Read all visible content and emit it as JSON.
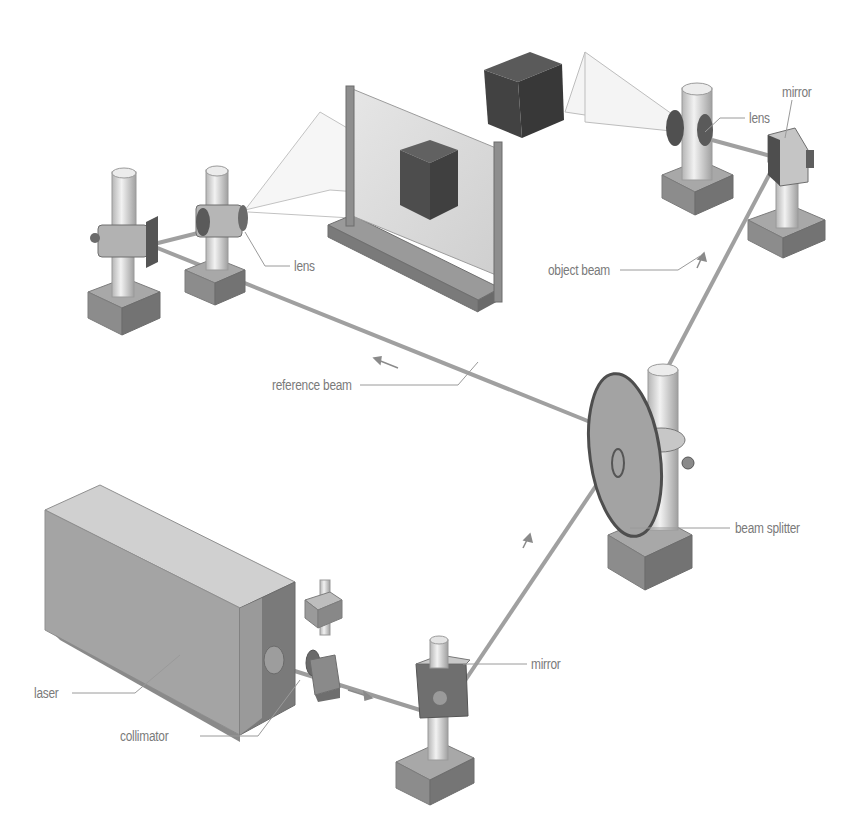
{
  "diagram": {
    "type": "holography-setup",
    "colors": {
      "background": "#ffffff",
      "label_text": "#7a7a7a",
      "leader_line": "#9a9a9a",
      "beam": "#a8a8a8",
      "metal_light": "#d9d9d9",
      "metal_mid": "#a9a9a9",
      "metal_dark": "#6e6e6e",
      "object_cube": "#4a4a4a"
    },
    "labels": {
      "lens_top": "lens",
      "mirror_top": "mirror",
      "lens_left": "lens",
      "object_beam": "object beam",
      "reference_beam": "reference beam",
      "beam_splitter": "beam splitter",
      "laser": "laser",
      "collimator": "collimator",
      "mirror_bottom": "mirror"
    },
    "components": [
      {
        "id": "laser",
        "label": "laser"
      },
      {
        "id": "collimator",
        "label": "collimator"
      },
      {
        "id": "mirror-bottom",
        "label": "mirror"
      },
      {
        "id": "beam-splitter",
        "label": "beam splitter"
      },
      {
        "id": "mirror-top-right",
        "label": "mirror"
      },
      {
        "id": "lens-top-right",
        "label": "lens"
      },
      {
        "id": "object-cube",
        "label": ""
      },
      {
        "id": "holographic-plate",
        "label": ""
      },
      {
        "id": "lens-left",
        "label": "lens"
      },
      {
        "id": "mirror-left",
        "label": ""
      }
    ],
    "beams": [
      {
        "id": "object-beam",
        "label": "object beam",
        "from": "beam-splitter",
        "to": "mirror-top-right"
      },
      {
        "id": "reference-beam",
        "label": "reference beam",
        "from": "beam-splitter",
        "to": "mirror-left"
      }
    ]
  }
}
